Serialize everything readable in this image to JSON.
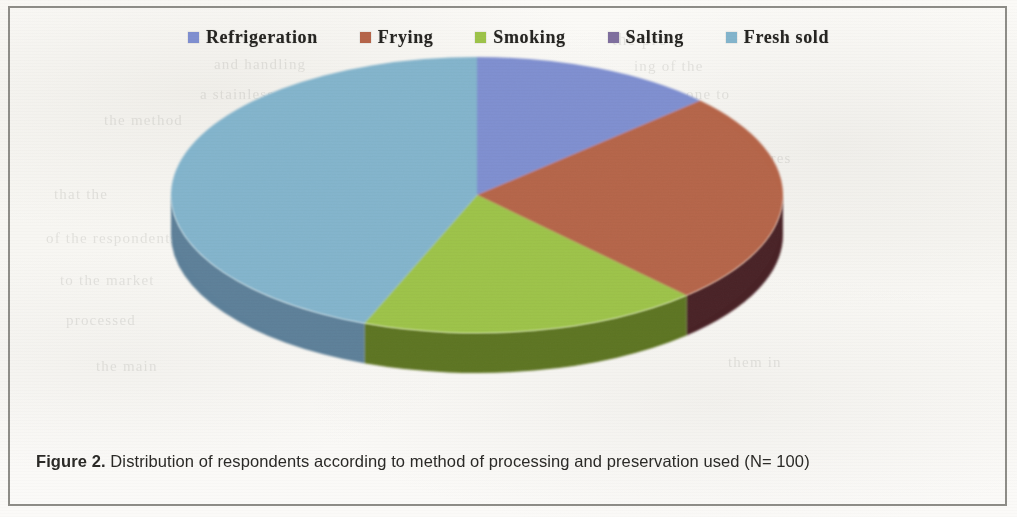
{
  "figure": {
    "caption_number": "Figure 2.",
    "caption_text": " Distribution of respondents according to method of processing and preservation used (N= 100)"
  },
  "legend": {
    "items": [
      {
        "label": "Refrigeration",
        "color": "#7f8fd0",
        "icon": "legend-swatch-icon"
      },
      {
        "label": "Frying",
        "color": "#b5654a",
        "icon": "legend-swatch-icon"
      },
      {
        "label": "Smoking",
        "color": "#9dc34a",
        "icon": "legend-swatch-icon"
      },
      {
        "label": "Salting",
        "color": "#7f6f9e",
        "icon": "legend-swatch-icon"
      },
      {
        "label": "Fresh sold",
        "color": "#83b4cc",
        "icon": "legend-swatch-icon"
      }
    ]
  },
  "ghost_text": [
    {
      "text": "the pro",
      "x": 612,
      "y": 30,
      "size": 17
    },
    {
      "text": "and handling",
      "x": 214,
      "y": 56,
      "size": 15
    },
    {
      "text": "ing of the",
      "x": 634,
      "y": 58,
      "size": 15
    },
    {
      "text": "a stainless",
      "x": 200,
      "y": 86,
      "size": 15
    },
    {
      "text": "one to",
      "x": 686,
      "y": 86,
      "size": 15
    },
    {
      "text": "the method",
      "x": 104,
      "y": 112,
      "size": 15
    },
    {
      "text": "of pres",
      "x": 742,
      "y": 150,
      "size": 15
    },
    {
      "text": "that the",
      "x": 54,
      "y": 186,
      "size": 15
    },
    {
      "text": "method used and",
      "x": 618,
      "y": 198,
      "size": 15
    },
    {
      "text": "of the respondents",
      "x": 46,
      "y": 230,
      "size": 15
    },
    {
      "text": "smoked and sold",
      "x": 616,
      "y": 244,
      "size": 15
    },
    {
      "text": "to the market",
      "x": 60,
      "y": 272,
      "size": 15
    },
    {
      "text": "of the catch",
      "x": 658,
      "y": 286,
      "size": 15
    },
    {
      "text": "processed",
      "x": 66,
      "y": 312,
      "size": 15
    },
    {
      "text": "them in",
      "x": 728,
      "y": 354,
      "size": 15
    },
    {
      "text": "the main",
      "x": 96,
      "y": 358,
      "size": 15
    }
  ],
  "chart_data": {
    "type": "pie",
    "title": "Distribution of respondents according to method of processing and preservation used",
    "subtitle": "N= 100",
    "total": 100,
    "unit": "percent",
    "legend_position": "top",
    "three_d": true,
    "start_angle_deg": 0,
    "direction": "clockwise",
    "categories": [
      "Refrigeration",
      "Frying",
      "Smoking",
      "Salting",
      "Fresh sold"
    ],
    "values": [
      13,
      25,
      18,
      0,
      44
    ],
    "colors": [
      "#7f8fd0",
      "#b5654a",
      "#9dc34a",
      "#7f6f9e",
      "#83b4cc"
    ],
    "side_colors": [
      "#5a66a0",
      "#4a2226",
      "#5d7420",
      "#5a4d74",
      "#5d8099"
    ],
    "slices": [
      {
        "name": "Refrigeration",
        "value": 13,
        "angle_deg": 47,
        "color": "#7f8fd0"
      },
      {
        "name": "Frying",
        "value": 25,
        "angle_deg": 90,
        "color": "#b5654a"
      },
      {
        "name": "Smoking",
        "value": 18,
        "angle_deg": 65,
        "color": "#9dc34a"
      },
      {
        "name": "Salting",
        "value": 0,
        "angle_deg": 0,
        "color": "#7f6f9e"
      },
      {
        "name": "Fresh sold",
        "value": 44,
        "angle_deg": 158,
        "color": "#83b4cc"
      }
    ]
  },
  "geometry": {
    "cx": 477,
    "cy": 195,
    "rx": 306,
    "ry": 138,
    "depth": 40
  }
}
